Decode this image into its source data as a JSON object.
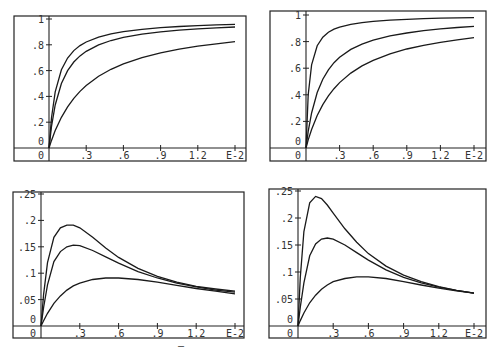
{
  "chart_data": [
    {
      "type": "line",
      "id": "top-left",
      "title": "",
      "xlabel": "",
      "ylabel": "",
      "x_scale_label": "E-2",
      "xlim": [
        0,
        1.5
      ],
      "ylim": [
        0,
        1
      ],
      "x_ticks": [
        "0",
        ".3",
        ".6",
        ".9",
        "1.2",
        "E-2"
      ],
      "x_tick_values": [
        0,
        0.3,
        0.6,
        0.9,
        1.2,
        1.5
      ],
      "y_ticks": [
        "0",
        ".2",
        ".4",
        ".6",
        ".8",
        "1"
      ],
      "y_tick_values": [
        0,
        0.2,
        0.4,
        0.6,
        0.8,
        1.0
      ],
      "grid": false,
      "x": [
        0,
        0.02,
        0.05,
        0.1,
        0.15,
        0.2,
        0.25,
        0.3,
        0.4,
        0.5,
        0.6,
        0.75,
        0.9,
        1.05,
        1.2,
        1.35,
        1.5
      ],
      "series": [
        {
          "name": "curve-1",
          "values": [
            0,
            0.235,
            0.435,
            0.606,
            0.698,
            0.755,
            0.794,
            0.822,
            0.86,
            0.885,
            0.902,
            0.92,
            0.933,
            0.942,
            0.949,
            0.954,
            0.958
          ]
        },
        {
          "name": "curve-2",
          "values": [
            0,
            0.167,
            0.333,
            0.5,
            0.6,
            0.667,
            0.714,
            0.75,
            0.8,
            0.833,
            0.857,
            0.882,
            0.9,
            0.913,
            0.923,
            0.931,
            0.938
          ]
        },
        {
          "name": "curve-3",
          "values": [
            0,
            0.059,
            0.135,
            0.238,
            0.319,
            0.385,
            0.439,
            0.484,
            0.556,
            0.61,
            0.652,
            0.701,
            0.738,
            0.766,
            0.789,
            0.808,
            0.824
          ]
        }
      ],
      "layout": {
        "frame": [
          14,
          16,
          246,
          161
        ],
        "origin": [
          49,
          148
        ],
        "x_end_px": 235,
        "y_top_px": 19
      }
    },
    {
      "type": "line",
      "id": "top-right",
      "title": "",
      "xlabel": "",
      "ylabel": "",
      "x_scale_label": "E-2",
      "xlim": [
        0,
        1.5
      ],
      "ylim": [
        0,
        1
      ],
      "x_ticks": [
        "0",
        ".3",
        ".6",
        ".9",
        "1.2",
        "E-2"
      ],
      "x_tick_values": [
        0,
        0.3,
        0.6,
        0.9,
        1.2,
        1.5
      ],
      "y_ticks": [
        "0",
        ".2",
        ".4",
        ".6",
        ".8",
        "1"
      ],
      "y_tick_values": [
        0,
        0.2,
        0.4,
        0.6,
        0.8,
        1.0
      ],
      "grid": false,
      "x": [
        0,
        0.02,
        0.05,
        0.1,
        0.15,
        0.2,
        0.25,
        0.3,
        0.4,
        0.5,
        0.6,
        0.75,
        0.9,
        1.05,
        1.2,
        1.35,
        1.5
      ],
      "series": [
        {
          "name": "curve-1",
          "values": [
            0,
            0.4,
            0.625,
            0.769,
            0.833,
            0.87,
            0.893,
            0.909,
            0.93,
            0.943,
            0.952,
            0.962,
            0.968,
            0.972,
            0.976,
            0.978,
            0.98
          ]
        },
        {
          "name": "curve-2",
          "values": [
            0,
            0.125,
            0.263,
            0.417,
            0.517,
            0.588,
            0.641,
            0.682,
            0.741,
            0.781,
            0.811,
            0.843,
            0.865,
            0.882,
            0.896,
            0.906,
            0.915
          ]
        },
        {
          "name": "curve-3",
          "values": [
            0,
            0.061,
            0.139,
            0.244,
            0.326,
            0.392,
            0.446,
            0.492,
            0.563,
            0.617,
            0.659,
            0.708,
            0.744,
            0.772,
            0.795,
            0.813,
            0.829
          ]
        }
      ],
      "layout": {
        "frame": [
          270,
          11,
          486,
          161
        ],
        "origin": [
          306,
          148
        ],
        "x_end_px": 474,
        "y_top_px": 15
      }
    },
    {
      "type": "line",
      "id": "bottom-left",
      "title": "",
      "xlabel": "",
      "ylabel": "",
      "x_scale_label": "E-2",
      "xlim": [
        0,
        1.5
      ],
      "ylim": [
        0,
        0.25
      ],
      "x_ticks": [
        "0",
        ".3",
        ".6",
        ".9",
        "1.2",
        "E-2"
      ],
      "x_tick_values": [
        0,
        0.3,
        0.6,
        0.9,
        1.2,
        1.5
      ],
      "y_ticks": [
        "0",
        ".05",
        ".1",
        ".15",
        ".2",
        ".25"
      ],
      "y_tick_values": [
        0,
        0.05,
        0.1,
        0.15,
        0.2,
        0.25
      ],
      "grid": false,
      "x": [
        0,
        0.02,
        0.05,
        0.1,
        0.15,
        0.2,
        0.25,
        0.3,
        0.4,
        0.5,
        0.6,
        0.75,
        0.9,
        1.05,
        1.2,
        1.35,
        1.5
      ],
      "series": [
        {
          "name": "curve-1",
          "values": [
            0,
            0.06,
            0.12,
            0.168,
            0.186,
            0.191,
            0.191,
            0.186,
            0.168,
            0.148,
            0.13,
            0.109,
            0.094,
            0.083,
            0.075,
            0.07,
            0.066
          ]
        },
        {
          "name": "curve-2",
          "values": [
            0,
            0.035,
            0.078,
            0.122,
            0.141,
            0.15,
            0.153,
            0.152,
            0.143,
            0.131,
            0.119,
            0.103,
            0.091,
            0.081,
            0.074,
            0.068,
            0.064
          ]
        },
        {
          "name": "curve-3",
          "values": [
            0,
            0.01,
            0.024,
            0.043,
            0.057,
            0.068,
            0.076,
            0.081,
            0.088,
            0.091,
            0.091,
            0.088,
            0.083,
            0.077,
            0.071,
            0.066,
            0.061
          ]
        }
      ],
      "layout": {
        "frame": [
          13,
          192,
          244,
          338
        ],
        "origin": [
          41,
          326
        ],
        "x_end_px": 235,
        "y_top_px": 194
      }
    },
    {
      "type": "line",
      "id": "bottom-right",
      "title": "",
      "xlabel": "",
      "ylabel": "",
      "x_scale_label": "E-2",
      "xlim": [
        0,
        1.5
      ],
      "ylim": [
        0,
        0.25
      ],
      "x_ticks": [
        "0",
        ".3",
        ".6",
        ".9",
        "1.2",
        "E-2"
      ],
      "x_tick_values": [
        0,
        0.3,
        0.6,
        0.9,
        1.2,
        1.5
      ],
      "y_ticks": [
        "0",
        ".05",
        ".1",
        ".15",
        ".2",
        ".25"
      ],
      "y_tick_values": [
        0,
        0.05,
        0.1,
        0.15,
        0.2,
        0.25
      ],
      "grid": false,
      "x": [
        0,
        0.02,
        0.05,
        0.1,
        0.15,
        0.2,
        0.25,
        0.3,
        0.4,
        0.5,
        0.6,
        0.75,
        0.9,
        1.05,
        1.2,
        1.35,
        1.5
      ],
      "series": [
        {
          "name": "curve-1",
          "values": [
            0,
            0.09,
            0.175,
            0.228,
            0.24,
            0.236,
            0.224,
            0.209,
            0.18,
            0.155,
            0.134,
            0.111,
            0.094,
            0.082,
            0.073,
            0.066,
            0.061
          ]
        },
        {
          "name": "curve-2",
          "values": [
            0,
            0.035,
            0.08,
            0.13,
            0.152,
            0.161,
            0.163,
            0.161,
            0.15,
            0.136,
            0.122,
            0.104,
            0.09,
            0.08,
            0.072,
            0.066,
            0.061
          ]
        },
        {
          "name": "curve-3",
          "values": [
            0,
            0.01,
            0.024,
            0.043,
            0.057,
            0.068,
            0.076,
            0.082,
            0.088,
            0.091,
            0.091,
            0.088,
            0.082,
            0.076,
            0.07,
            0.065,
            0.061
          ]
        }
      ],
      "layout": {
        "frame": [
          269,
          189,
          486,
          338
        ],
        "origin": [
          298,
          326
        ],
        "x_end_px": 474,
        "y_top_px": 191
      }
    }
  ],
  "stray_mark": {
    "text": "–",
    "x": 180,
    "y": 350
  }
}
